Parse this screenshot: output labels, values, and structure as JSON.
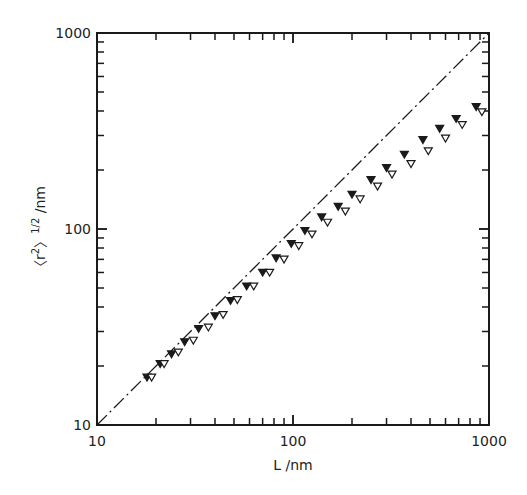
{
  "chart_data": {
    "type": "scatter",
    "title": "",
    "xlabel": "L /nm",
    "ylabel": "<r²>^1/2 /nm",
    "xscale": "log",
    "yscale": "log",
    "xlim": [
      10,
      1000
    ],
    "ylim": [
      10,
      1000
    ],
    "x_tick_labels": [
      "10",
      "100",
      "1000"
    ],
    "y_tick_labels": [
      "10",
      "100",
      "1000"
    ],
    "grid": false,
    "legend": null,
    "reference_line": {
      "name": "r = L",
      "style": "dash-dot",
      "x": [
        10,
        1000
      ],
      "y": [
        10,
        1000
      ]
    },
    "series": [
      {
        "name": "filled triangles",
        "marker": "filled-down-triangle",
        "x": [
          18,
          21,
          24,
          28,
          33,
          40,
          48,
          58,
          70,
          82,
          98,
          115,
          140,
          170,
          200,
          250,
          300,
          370,
          460,
          560,
          680,
          860
        ],
        "y": [
          17.5,
          20.5,
          23,
          26.5,
          31,
          36,
          43,
          51,
          60,
          71,
          84,
          98,
          115,
          130,
          150,
          178,
          205,
          240,
          285,
          325,
          365,
          420
        ]
      },
      {
        "name": "open triangles",
        "marker": "open-down-triangle",
        "x": [
          19,
          22,
          26,
          31,
          37,
          44,
          52,
          63,
          76,
          90,
          107,
          125,
          150,
          185,
          220,
          270,
          320,
          400,
          490,
          600,
          730,
          920
        ],
        "y": [
          17.5,
          20.5,
          23.5,
          27,
          31.5,
          36.5,
          43.5,
          51,
          60,
          70,
          82,
          94,
          108,
          123,
          142,
          165,
          190,
          215,
          250,
          290,
          340,
          395
        ]
      }
    ]
  },
  "axes": {
    "x_label": "L /nm",
    "y_label_main": "〈r",
    "y_label_sup1": "2",
    "y_label_mid": "〉",
    "y_label_sup2": "1/2",
    "y_label_unit": " /nm",
    "x_ticks": [
      "10",
      "100",
      "1000"
    ],
    "y_ticks": [
      "10",
      "100",
      "1000"
    ]
  }
}
